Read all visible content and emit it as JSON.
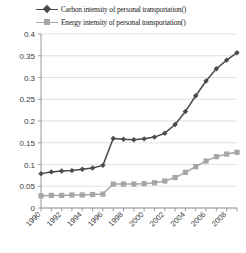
{
  "legend": {
    "position": "top",
    "entries": [
      {
        "label": "Carbon intensity of personal transportation()",
        "marker": "diamond-marker-icon",
        "color": "#4a4a4a"
      },
      {
        "label": "Energy intensity of personal transportation()",
        "marker": "square-marker-icon",
        "color": "#a6a6a6"
      }
    ]
  },
  "chart_data": {
    "type": "line",
    "title": "",
    "subtitle": "",
    "xlabel": "",
    "ylabel": "",
    "grid": true,
    "legend_position": "top",
    "x": [
      1990,
      1991,
      1992,
      1993,
      1994,
      1995,
      1996,
      1997,
      1998,
      1999,
      2000,
      2001,
      2002,
      2003,
      2004,
      2005,
      2006,
      2007,
      2008,
      2009
    ],
    "categories": [
      "1990",
      "1991",
      "1992",
      "1993",
      "1994",
      "1995",
      "1996",
      "1997",
      "1998",
      "1999",
      "2000",
      "2001",
      "2002",
      "2003",
      "2004",
      "2005",
      "2006",
      "2007",
      "2008",
      "2009"
    ],
    "xtick_labels": [
      "1990",
      "1992",
      "1994",
      "1996",
      "1998",
      "2000",
      "2002",
      "2004",
      "2006",
      "2008"
    ],
    "xtick_values": [
      1990,
      1992,
      1994,
      1996,
      1998,
      2000,
      2002,
      2004,
      2006,
      2008
    ],
    "ytick_labels": [
      "0",
      "0.05",
      "0.1",
      "0.15",
      "0.2",
      "0.25",
      "0.3",
      "0.35",
      "0.4"
    ],
    "ytick_values": [
      0,
      0.05,
      0.1,
      0.15,
      0.2,
      0.25,
      0.3,
      0.35,
      0.4
    ],
    "ylim": [
      0,
      0.4
    ],
    "xlim": [
      1990,
      2009
    ],
    "series": [
      {
        "name": "Carbon intensity of personal transportation()",
        "color": "#4a4a4a",
        "marker": "diamond",
        "values": [
          0.079,
          0.083,
          0.085,
          0.086,
          0.089,
          0.092,
          0.098,
          0.16,
          0.158,
          0.157,
          0.159,
          0.163,
          0.172,
          0.192,
          0.222,
          0.258,
          0.292,
          0.32,
          0.34,
          0.357
        ]
      },
      {
        "name": "Energy intensity of personal transportation()",
        "color": "#a6a6a6",
        "marker": "square",
        "values": [
          0.028,
          0.029,
          0.029,
          0.03,
          0.03,
          0.031,
          0.032,
          0.055,
          0.055,
          0.055,
          0.056,
          0.058,
          0.062,
          0.07,
          0.082,
          0.095,
          0.108,
          0.118,
          0.124,
          0.128
        ]
      }
    ]
  }
}
